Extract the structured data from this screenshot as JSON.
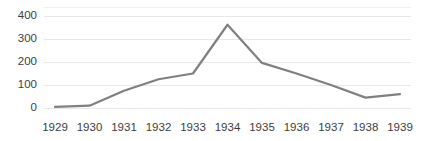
{
  "chart_data": {
    "type": "line",
    "title": "",
    "xlabel": "",
    "ylabel": "",
    "categories": [
      "1929",
      "1930",
      "1931",
      "1932",
      "1933",
      "1934",
      "1935",
      "1936",
      "1937",
      "1938",
      "1939"
    ],
    "values": [
      5,
      10,
      75,
      125,
      150,
      362,
      196,
      150,
      100,
      45,
      60
    ],
    "series": [
      {
        "name": "",
        "values": [
          5,
          10,
          75,
          125,
          150,
          362,
          196,
          150,
          100,
          45,
          60
        ]
      }
    ],
    "ylim": [
      0,
      400
    ],
    "yticks": [
      0,
      100,
      200,
      300,
      400
    ],
    "ytick_labels": [
      "0",
      "100",
      "200",
      "300",
      "400"
    ],
    "xtick_labels": [
      "1929",
      "1930",
      "1931",
      "1932",
      "1933",
      "1934",
      "1935",
      "1936",
      "1937",
      "1938",
      "1939"
    ],
    "grid": "horizontal",
    "legend": "none",
    "line_color": "#808080",
    "grid_color": "#e8e8e8",
    "text_color": "#3c3c3c",
    "background_color": "#ffffff"
  }
}
